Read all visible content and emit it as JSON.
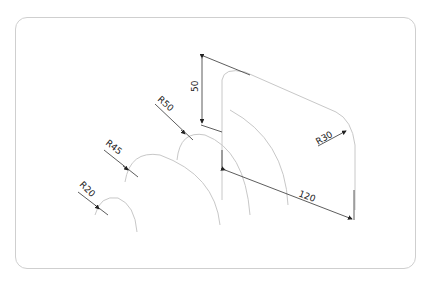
{
  "drawing": {
    "type": "isometric technical drawing",
    "dimensions": {
      "height": "50",
      "length": "120",
      "radius_main": "R30",
      "radius_1": "R50",
      "radius_2": "R45",
      "radius_3": "R20"
    },
    "colors": {
      "arc_line": "#c8c8c8",
      "dimension_line": "#333333",
      "frame": "#cfcfcf",
      "text": "#222222"
    }
  }
}
